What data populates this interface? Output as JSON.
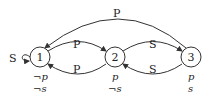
{
  "nodes": [
    {
      "id": "1",
      "label": "1",
      "props": [
        "¬p",
        "¬s"
      ]
    },
    {
      "id": "2",
      "label": "2",
      "props": [
        "p",
        "¬s"
      ]
    },
    {
      "id": "3",
      "label": "3",
      "props": [
        "p",
        "s"
      ]
    }
  ],
  "edges": [
    {
      "from": "1",
      "to": "1",
      "label": "S"
    },
    {
      "from": "1",
      "to": "2",
      "label": "P"
    },
    {
      "from": "2",
      "to": "1",
      "label": "P"
    },
    {
      "from": "2",
      "to": "3",
      "label": "S"
    },
    {
      "from": "3",
      "to": "2",
      "label": "S"
    },
    {
      "from": "3",
      "to": "1",
      "label": "P"
    }
  ],
  "colors": {
    "stroke": "#333333",
    "background": "#ffffff"
  }
}
